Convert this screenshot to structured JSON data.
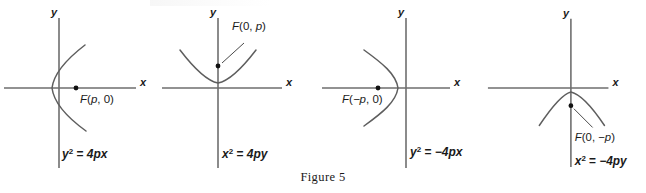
{
  "figure": {
    "caption": "Figure 5",
    "panel_count": 4,
    "colors": {
      "axis": "#6e6e6e",
      "curve": "#5e5e5e",
      "text": "#1a1a1a",
      "focus_dot": "#111111",
      "background": "#ffffff"
    }
  },
  "panels": [
    {
      "id": "parabola-opens-right",
      "x_axis_label": "x",
      "y_axis_label": "y",
      "focus_label": "F(p, 0)",
      "focus_label_parts": {
        "f": "F",
        "open": "(",
        "coord1": "p",
        "comma": ", ",
        "coord2": "0",
        "close": ")"
      },
      "equation": "y² = 4px",
      "equation_parts": {
        "base": "y",
        "exponent": "2",
        "equals": " = ",
        "rhs": "4px"
      },
      "opens": "right",
      "focus_point": {
        "x": 1,
        "y": 0
      }
    },
    {
      "id": "parabola-opens-up",
      "x_axis_label": "x",
      "y_axis_label": "y",
      "focus_label": "F(0, p)",
      "focus_label_parts": {
        "f": "F",
        "open": "(",
        "coord1": "0",
        "comma": ", ",
        "coord2": "p",
        "close": ")"
      },
      "equation": "x² = 4py",
      "equation_parts": {
        "base": "x",
        "exponent": "2",
        "equals": " = ",
        "rhs": "4py"
      },
      "opens": "up",
      "focus_point": {
        "x": 0,
        "y": 1
      }
    },
    {
      "id": "parabola-opens-left",
      "x_axis_label": "x",
      "y_axis_label": "y",
      "focus_label": "F(−p, 0)",
      "focus_label_parts": {
        "f": "F",
        "open": "(",
        "coord1": "−p",
        "comma": ", ",
        "coord2": "0",
        "close": ")"
      },
      "equation": "y² = −4px",
      "equation_parts": {
        "base": "y",
        "exponent": "2",
        "equals": " = ",
        "rhs": "−4px"
      },
      "opens": "left",
      "focus_point": {
        "x": -1,
        "y": 0
      }
    },
    {
      "id": "parabola-opens-down",
      "x_axis_label": "x",
      "y_axis_label": "y",
      "focus_label": "F(0, −p)",
      "focus_label_parts": {
        "f": "F",
        "open": "(",
        "coord1": "0",
        "comma": ", ",
        "coord2": "−p",
        "close": ")"
      },
      "equation": "x² = −4py",
      "equation_parts": {
        "base": "x",
        "exponent": "2",
        "equals": " = ",
        "rhs": "−4py"
      },
      "opens": "down",
      "focus_point": {
        "x": 0,
        "y": -1
      }
    }
  ]
}
